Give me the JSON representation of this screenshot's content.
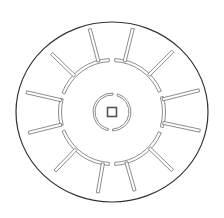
{
  "diagram": {
    "kind": "circular-maze",
    "colors": {
      "background": "#ffffff",
      "outer_stroke": "#333333",
      "wall_stroke": "#6e6e6e",
      "wall_fill": "#ffffff"
    },
    "center": [
      112,
      112
    ],
    "outer_ring": {
      "rx": 96,
      "ry": 90
    },
    "inner_ring": {
      "r": 52,
      "wall_thickness": 3,
      "gaps_deg": [
        -90,
        90,
        -162,
        162,
        -20,
        20
      ]
    },
    "core_ring": {
      "r": 18,
      "wall_thickness": 2,
      "gaps_deg": [
        -80,
        95
      ]
    },
    "center_square": {
      "size": 9
    },
    "spokes": [
      {
        "angle": -105,
        "inner": 52,
        "outer": 86
      },
      {
        "angle": -76,
        "inner": 52,
        "outer": 86
      },
      {
        "angle": -136,
        "inner": 52,
        "outer": 84
      },
      {
        "angle": -45,
        "inner": 52,
        "outer": 86
      },
      {
        "angle": -167,
        "inner": 52,
        "outer": 88
      },
      {
        "angle": -14,
        "inner": 52,
        "outer": 90
      },
      {
        "angle": 166,
        "inner": 52,
        "outer": 86
      },
      {
        "angle": 12,
        "inner": 52,
        "outer": 90
      },
      {
        "angle": 134,
        "inner": 52,
        "outer": 82
      },
      {
        "angle": 44,
        "inner": 52,
        "outer": 84
      },
      {
        "angle": 100,
        "inner": 52,
        "outer": 82
      },
      {
        "angle": 74,
        "inner": 52,
        "outer": 82
      }
    ]
  }
}
